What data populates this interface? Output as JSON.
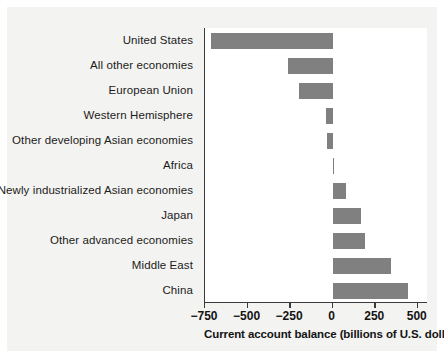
{
  "chart_data": {
    "type": "bar",
    "orientation": "horizontal",
    "title": "",
    "xlabel": "Current account balance (billions of U.S. dollars)",
    "ylabel": "",
    "xlim": [
      -750,
      560
    ],
    "xticks": [
      -750,
      -500,
      -250,
      0,
      250,
      500
    ],
    "xtick_labels": [
      "−750",
      "−500",
      "−250",
      "0",
      "250",
      "500"
    ],
    "grid": false,
    "legend": false,
    "bar_color": "#808080",
    "axis_color": "#3a3a3a",
    "background": "#ffffff",
    "plate_color": "#f3f3f1",
    "categories": [
      "United States",
      "All other economies",
      "European Union",
      "Western Hemisphere",
      "Other developing Asian economies",
      "Africa",
      "Newly industrialized Asian economies",
      "Japan",
      "Other advanced economies",
      "Middle East",
      "China"
    ],
    "values": [
      -715,
      -260,
      -195,
      -40,
      -35,
      10,
      80,
      165,
      190,
      345,
      445
    ]
  }
}
